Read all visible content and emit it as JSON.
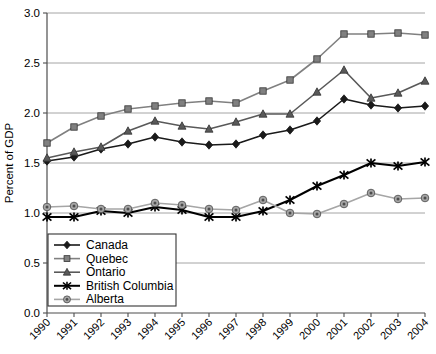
{
  "chart_data": {
    "type": "line",
    "title": "",
    "xlabel": "",
    "ylabel": "Percent of GDP",
    "ylim": [
      0.0,
      3.0
    ],
    "yticks": [
      0.0,
      0.5,
      1.0,
      1.5,
      2.0,
      2.5,
      3.0
    ],
    "ytick_labels": [
      "0.0",
      "0.5",
      "1.0",
      "1.5",
      "2.0",
      "2.5",
      "3.0"
    ],
    "grid": true,
    "legend_position": "lower-left",
    "categories": [
      "1990",
      "1991",
      "1992",
      "1993",
      "1994",
      "1995",
      "1996",
      "1997",
      "1998",
      "1999",
      "2000",
      "2001",
      "2002",
      "2003",
      "2004"
    ],
    "series": [
      {
        "name": "Canada",
        "color": "#1a1a1a",
        "marker": "diamond",
        "values": [
          1.52,
          1.56,
          1.64,
          1.69,
          1.76,
          1.71,
          1.68,
          1.69,
          1.78,
          1.83,
          1.92,
          2.14,
          2.08,
          2.05,
          2.07
        ]
      },
      {
        "name": "Quebec",
        "color": "#808080",
        "marker": "square",
        "values": [
          1.7,
          1.86,
          1.97,
          2.04,
          2.07,
          2.1,
          2.12,
          2.1,
          2.22,
          2.33,
          2.54,
          2.79,
          2.79,
          2.8,
          2.78
        ]
      },
      {
        "name": "Ontario",
        "color": "#595959",
        "marker": "triangle",
        "values": [
          1.55,
          1.61,
          1.66,
          1.82,
          1.92,
          1.87,
          1.84,
          1.91,
          1.99,
          1.99,
          2.21,
          2.43,
          2.15,
          2.2,
          2.32
        ]
      },
      {
        "name": "British Columbia",
        "color": "#000000",
        "marker": "cross-bar",
        "values": [
          0.96,
          0.96,
          1.02,
          1.0,
          1.06,
          1.03,
          0.96,
          0.96,
          1.02,
          1.13,
          1.27,
          1.38,
          1.5,
          1.47,
          1.51
        ]
      },
      {
        "name": "Alberta",
        "color": "#a6a6a6",
        "marker": "circle-dot",
        "values": [
          1.06,
          1.07,
          1.04,
          1.04,
          1.1,
          1.08,
          1.04,
          1.03,
          1.13,
          1.0,
          0.99,
          1.09,
          1.2,
          1.14,
          1.15
        ]
      }
    ]
  }
}
